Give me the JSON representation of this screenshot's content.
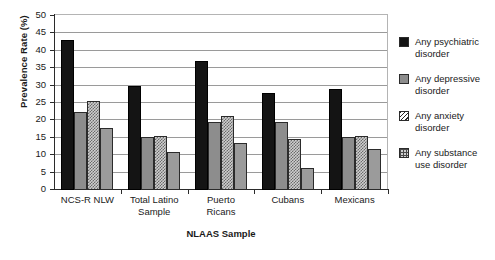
{
  "chart_data": {
    "type": "bar",
    "title": "",
    "xlabel": "NLAAS Sample",
    "ylabel": "Prevalence Rate (%)",
    "ylim": [
      0,
      50
    ],
    "ytick_values": [
      50,
      45,
      40,
      35,
      30,
      25,
      20,
      15,
      10,
      5,
      0
    ],
    "grid": true,
    "legend_position": "right",
    "categories": [
      "NCS-R NLW",
      "Total Latino Sample",
      "Puerto Ricans",
      "Cubans",
      "Mexicans"
    ],
    "category_lines": [
      [
        "NCS-R NLW"
      ],
      [
        "Total Latino",
        "Sample"
      ],
      [
        "Puerto",
        "Ricans"
      ],
      [
        "Cubans"
      ],
      [
        "Mexicans"
      ]
    ],
    "series": [
      {
        "name": "Any psychiatric disorder",
        "name_lines": [
          "Any psychiatric",
          "disorder"
        ],
        "pattern": "solid-black",
        "color": "#141414",
        "values": [
          43.0,
          29.9,
          37.1,
          28.0,
          29.0
        ]
      },
      {
        "name": "Any depressive disorder",
        "name_lines": [
          "Any depressive",
          "disorder"
        ],
        "pattern": "solid-gray",
        "color": "#8d8d8d",
        "values": [
          22.4,
          15.3,
          19.6,
          19.6,
          15.2
        ]
      },
      {
        "name": "Any anxiety disorder",
        "name_lines": [
          "Any anxiety",
          "disorder"
        ],
        "pattern": "diagonal-hatch",
        "color": "#cfcfcf",
        "values": [
          25.7,
          15.6,
          21.4,
          14.7,
          15.4
        ]
      },
      {
        "name": "Any substance use disorder",
        "name_lines": [
          "Any substance",
          "use disorder"
        ],
        "pattern": "grid-checker",
        "color": "#9b9b9b",
        "values": [
          17.8,
          11.0,
          13.5,
          6.3,
          11.7
        ]
      }
    ]
  }
}
